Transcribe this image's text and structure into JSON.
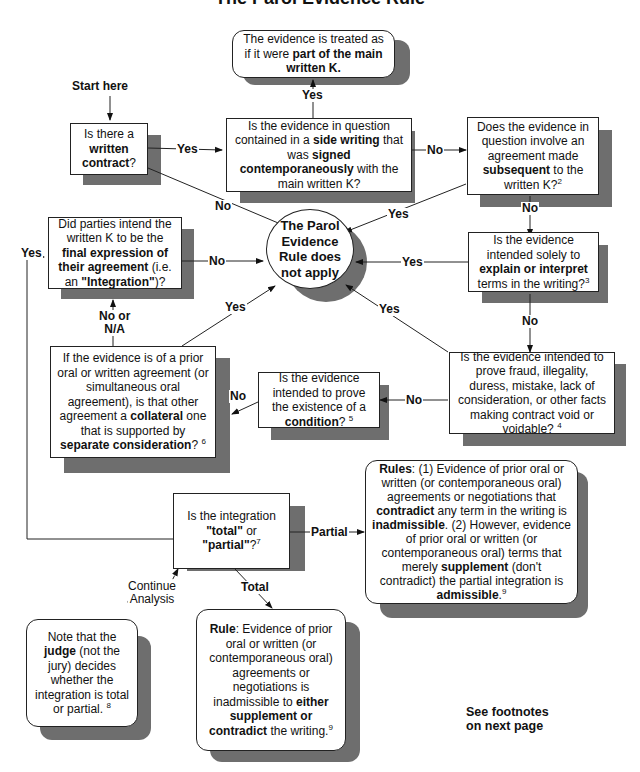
{
  "diagram": {
    "title_fragment": "The Parol Evidence Rule",
    "start_label": "Start here",
    "nodes": {
      "treated_as_part": {
        "pre": "The evidence is treated as if it were ",
        "bold": "part of the main written K.",
        "post": ""
      },
      "written_contract": {
        "pre": "Is there a ",
        "bold": "written contract",
        "post": "?"
      },
      "side_writing": {
        "pre1": "Is the evidence in question contained in a ",
        "bold1": "side writing",
        "pre2": " that was ",
        "bold2": "signed contemporaneously",
        "post": " with the main written K?"
      },
      "subsequent": {
        "pre": "Does the evidence in question involve an agreement made ",
        "bold": "subsequent",
        "post": " to the written K?",
        "footnote": "2"
      },
      "final_expression": {
        "pre": "Did parties intend the written K to be the ",
        "bold1": "final expression of their agreement",
        "mid": " (i.e. an ",
        "bold2": "\"Integration\"",
        "post": ")?"
      },
      "per_not_apply": {
        "text": "The Parol Evidence Rule does not apply"
      },
      "explain_interpret": {
        "pre": "Is the evidence intended solely to ",
        "bold": "explain or interpret",
        "post": " terms in the writing?",
        "footnote": "3"
      },
      "collateral": {
        "pre": "If the evidence is of a prior oral or written agreement (or simultaneous oral agreement), is that other agreement a ",
        "bold1": "collateral",
        "mid": " one that is supported by ",
        "bold2": "separate consideration",
        "post": "? ",
        "footnote": "6"
      },
      "condition": {
        "pre": "Is the evidence intended to prove the existence of a ",
        "bold": "condition",
        "post": "? ",
        "footnote": "5"
      },
      "fraud": {
        "text": "Is the evidence intended to prove fraud, illegality, duress, mistake, lack of consideration, or other facts making contract void or voidable? ",
        "footnote": "4"
      },
      "total_partial": {
        "pre": "Is the integration ",
        "bold1": "\"total\"",
        "mid": " or ",
        "bold2": "\"partial\"",
        "post": "?",
        "footnote": "7"
      },
      "rules_partial": {
        "b1": "Rules",
        "t1": ": (1) Evidence of prior oral or written (or contemporaneous oral) agreements or negotiations that ",
        "b2": "contradict",
        "t2": "  any term in the writing is ",
        "b3": "inadmissible",
        "t3": ". (2) However, evidence of prior oral or written (or contemporaneous oral) terms that merely ",
        "b4": "supplement",
        "t4": "  (don't contradict) the partial integration is ",
        "b5": "admissible",
        "t5": ".",
        "footnote": "9"
      },
      "judge_note": {
        "pre": "Note that the ",
        "bold": "judge",
        "post": " (not the jury) decides whether the integration is total or partial. ",
        "footnote": "8"
      },
      "rule_total": {
        "b1": "Rule",
        "t1": ": Evidence of prior oral or written (or contemporaneous oral) agreements or negotiations is inadmissible to ",
        "b2": "either supplement or contradict",
        "t2": " the writing.",
        "footnote": "9"
      }
    },
    "edge_labels": {
      "yes_side_to_treated": "Yes",
      "yes_written_to_side": "Yes",
      "no_written": "No",
      "no_side_to_subsequent": "No",
      "yes_subsequent": "Yes",
      "no_subsequent": "No",
      "no_final": "No",
      "yes_explain": "Yes",
      "no_explain": "No",
      "yes_left_loop": "Yes",
      "no_or_na": "No or\nN/A",
      "yes_collateral": "Yes",
      "yes_fraud": "Yes",
      "no_fraud": "No",
      "no_condition": "No",
      "partial": "Partial",
      "total": "Total",
      "continue_analysis": "Continue\nAnalysis"
    },
    "footer_note": "See footnotes\non next page",
    "colors": {
      "shadow": "#6e6e6e",
      "border": "#222222",
      "background": "#ffffff"
    }
  }
}
